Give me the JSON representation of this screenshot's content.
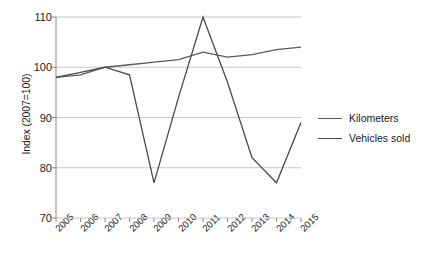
{
  "chart_data": {
    "type": "line",
    "title": "",
    "xlabel": "",
    "ylabel": "Index (2007=100)",
    "categories": [
      "2005",
      "2006",
      "2007",
      "2008",
      "2009",
      "2010",
      "2011",
      "2012",
      "2013",
      "2014",
      "2015"
    ],
    "ylim": [
      70,
      110
    ],
    "yticks": [
      70,
      80,
      90,
      100,
      110
    ],
    "ytick_labels": [
      "70",
      "80",
      "90",
      "100",
      "110"
    ],
    "grid": true,
    "legend_position": "right",
    "series": [
      {
        "name": "Kilometers",
        "color": "#5a5a5a",
        "values": [
          98.0,
          98.5,
          100.0,
          100.5,
          101.0,
          101.5,
          103.0,
          102.0,
          102.5,
          103.5,
          104.0
        ]
      },
      {
        "name": "Vehicles sold",
        "color": "#4a4a4a",
        "values": [
          98.0,
          99.0,
          100.0,
          98.5,
          77.0,
          94.0,
          110.0,
          97.0,
          82.0,
          77.0,
          89.0
        ]
      }
    ]
  },
  "axes": {
    "y_axis_label": "Index (2007=100)"
  },
  "legend": {
    "items": [
      {
        "label": "Kilometers"
      },
      {
        "label": "Vehicles sold"
      }
    ]
  },
  "colors": {
    "kilometers_line": "#5a5a5a",
    "vehicles_line": "#4a4a4a",
    "gridline": "#c8c8c8",
    "axis": "#8a8a8a",
    "background": "#ffffff"
  }
}
